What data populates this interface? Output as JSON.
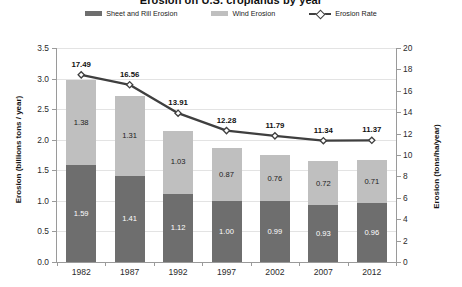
{
  "chart_data": {
    "type": "bar",
    "title": "Erosion on U.S. croplands by year",
    "categories": [
      "1982",
      "1987",
      "1992",
      "1997",
      "2002",
      "2007",
      "2012"
    ],
    "xlabel": "",
    "ylabel": "Erosion (billions tons / year)",
    "y2label": "Erosion (tons/ha/year)",
    "ylim": [
      0,
      3.5
    ],
    "y2lim": [
      0,
      20
    ],
    "yticks": [
      "0.0",
      "0.5",
      "1.0",
      "1.5",
      "2.0",
      "2.5",
      "3.0",
      "3.5"
    ],
    "y2ticks": [
      "0",
      "2",
      "4",
      "6",
      "8",
      "10",
      "12",
      "14",
      "16",
      "18",
      "20"
    ],
    "grid": true,
    "stacked": true,
    "legend_position": "top",
    "series": [
      {
        "name": "Sheet and Rill Erosion",
        "type": "bar",
        "axis": "left",
        "color": "#6e6e6e",
        "values": [
          1.59,
          1.41,
          1.12,
          1.0,
          0.99,
          0.93,
          0.96
        ],
        "labels": [
          "1.59",
          "1.41",
          "1.12",
          "1.00",
          "0.99",
          "0.93",
          "0.96"
        ]
      },
      {
        "name": "Wind Erosion",
        "type": "bar",
        "axis": "left",
        "color": "#bfbfbf",
        "values": [
          1.38,
          1.31,
          1.03,
          0.87,
          0.76,
          0.72,
          0.71
        ],
        "labels": [
          "1.38",
          "1.31",
          "1.03",
          "0.87",
          "0.76",
          "0.72",
          "0.71"
        ]
      },
      {
        "name": "Erosion Rate",
        "type": "line",
        "axis": "right",
        "color": "#3f3f3f",
        "marker": "diamond",
        "values": [
          17.49,
          16.56,
          13.91,
          12.28,
          11.79,
          11.34,
          11.37
        ],
        "labels": [
          "17.49",
          "16.56",
          "13.91",
          "12.28",
          "11.79",
          "11.34",
          "11.37"
        ]
      }
    ]
  }
}
